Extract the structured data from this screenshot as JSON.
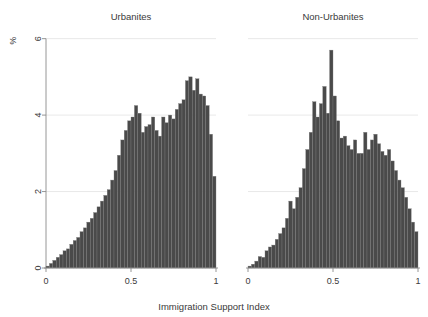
{
  "figure": {
    "width": 428,
    "height": 317,
    "background": "#ffffff",
    "bar_color": "#4a4a4a",
    "bar_edge_color": "#7e7e7e",
    "axis_color": "#8a8a8a",
    "grid_color": "#d8d8d8",
    "text_color": "#3a3a3a"
  },
  "ylabel": "%",
  "xlabel": "Immigration Support Index",
  "y_ticks": [
    "0",
    "2",
    "4",
    "6"
  ],
  "x_ticks": [
    "0",
    "0.5",
    "1"
  ],
  "chart_data": {
    "type": "bar",
    "title": "",
    "xlabel": "Immigration Support Index",
    "ylabel": "%",
    "ylim": [
      0,
      6.2
    ],
    "xlim": [
      0,
      1
    ],
    "grid": true,
    "legend": "none",
    "panels": [
      {
        "label": "Urbanites",
        "bin_width": 0.02,
        "x": [
          0.01,
          0.03,
          0.05,
          0.07,
          0.09,
          0.11,
          0.13,
          0.15,
          0.17,
          0.19,
          0.21,
          0.23,
          0.25,
          0.27,
          0.29,
          0.31,
          0.33,
          0.35,
          0.37,
          0.39,
          0.41,
          0.43,
          0.45,
          0.47,
          0.49,
          0.51,
          0.53,
          0.55,
          0.57,
          0.59,
          0.61,
          0.63,
          0.65,
          0.67,
          0.69,
          0.71,
          0.73,
          0.75,
          0.77,
          0.79,
          0.81,
          0.83,
          0.85,
          0.87,
          0.89,
          0.91,
          0.93,
          0.95,
          0.97,
          0.99
        ],
        "values": [
          0.05,
          0.12,
          0.2,
          0.28,
          0.35,
          0.45,
          0.5,
          0.62,
          0.72,
          0.8,
          0.95,
          1.05,
          1.2,
          1.3,
          1.45,
          1.6,
          1.75,
          1.9,
          2.05,
          2.3,
          2.55,
          2.95,
          3.35,
          3.6,
          3.85,
          3.95,
          4.25,
          4.05,
          3.55,
          3.7,
          3.75,
          3.95,
          3.6,
          3.45,
          3.95,
          3.8,
          4.0,
          3.9,
          4.15,
          4.3,
          4.4,
          4.9,
          5.0,
          4.65,
          4.95,
          4.55,
          4.5,
          4.25,
          3.5,
          2.4
        ],
        "ylim": [
          0,
          6.2
        ]
      },
      {
        "label": "Non-Urbanites",
        "bin_width": 0.02,
        "x": [
          0.01,
          0.03,
          0.05,
          0.07,
          0.09,
          0.11,
          0.13,
          0.15,
          0.17,
          0.19,
          0.21,
          0.23,
          0.25,
          0.27,
          0.29,
          0.31,
          0.33,
          0.35,
          0.37,
          0.39,
          0.41,
          0.43,
          0.45,
          0.47,
          0.49,
          0.51,
          0.53,
          0.55,
          0.57,
          0.59,
          0.61,
          0.63,
          0.65,
          0.67,
          0.69,
          0.71,
          0.73,
          0.75,
          0.77,
          0.79,
          0.81,
          0.83,
          0.85,
          0.87,
          0.89,
          0.91,
          0.93,
          0.95,
          0.97,
          0.99
        ],
        "values": [
          0.05,
          0.1,
          0.18,
          0.3,
          0.28,
          0.45,
          0.55,
          0.6,
          0.75,
          0.9,
          1.05,
          1.3,
          1.75,
          1.55,
          1.85,
          2.1,
          2.6,
          3.1,
          3.55,
          4.35,
          3.95,
          4.3,
          4.75,
          4.05,
          5.7,
          4.5,
          3.85,
          3.4,
          3.45,
          3.2,
          3.1,
          3.35,
          3.0,
          3.0,
          3.55,
          3.1,
          3.35,
          3.5,
          3.25,
          3.05,
          2.95,
          3.1,
          2.8,
          2.55,
          2.3,
          2.1,
          1.85,
          1.55,
          1.2,
          0.95
        ],
        "ylim": [
          0,
          6.2
        ]
      }
    ]
  }
}
